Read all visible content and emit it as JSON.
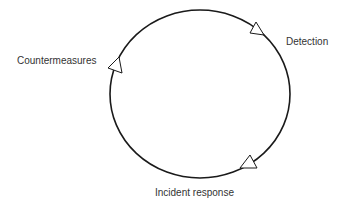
{
  "diagram": {
    "type": "cycle",
    "stroke_color": "#1a1a1a",
    "text_color": "#333333",
    "stages": [
      {
        "label": "Detection"
      },
      {
        "label": "Incident response"
      },
      {
        "label": "Countermeasures"
      }
    ]
  }
}
